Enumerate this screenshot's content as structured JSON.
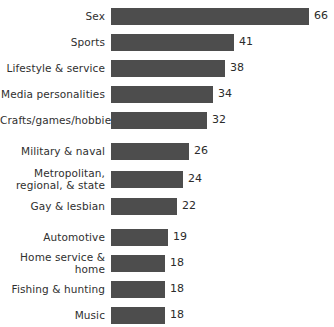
{
  "chart_data": {
    "type": "bar",
    "orientation": "horizontal",
    "title": "",
    "subtitle": "",
    "xlabel": "",
    "ylabel": "",
    "grid": false,
    "legend": false,
    "axis_visible": false,
    "value_labels": true,
    "xlim": [
      0,
      66
    ],
    "bar_color": "#4d4d4d",
    "background_color": "#ffffff",
    "categories": [
      "Sex",
      "Sports",
      "Lifestyle & service",
      "Media personalities",
      "Crafts/games/hobbies",
      "Military & naval",
      "Metropolitan,\nregional, & state",
      "Gay & lesbian",
      "Automotive",
      "Home service & home",
      "Fishing & hunting",
      "Music"
    ],
    "values": [
      66,
      41,
      38,
      34,
      32,
      26,
      24,
      22,
      19,
      18,
      18,
      18
    ],
    "groups": [
      {
        "rows": [
          0,
          1,
          2,
          3,
          4
        ]
      },
      {
        "rows": [
          5,
          6,
          7
        ]
      },
      {
        "rows": [
          8,
          9,
          10,
          11
        ]
      }
    ]
  },
  "rows": [
    {
      "label": "Sex",
      "value": "66"
    },
    {
      "label": "Sports",
      "value": "41"
    },
    {
      "label": "Lifestyle & service",
      "value": "38"
    },
    {
      "label": "Media personalities",
      "value": "34"
    },
    {
      "label": "Crafts/games/hobbies",
      "value": "32"
    },
    {
      "label": "Military & naval",
      "value": "26"
    },
    {
      "label": "Metropolitan,\nregional, & state",
      "value": "24"
    },
    {
      "label": "Gay & lesbian",
      "value": "22"
    },
    {
      "label": "Automotive",
      "value": "19"
    },
    {
      "label": "Home service & home",
      "value": "18"
    },
    {
      "label": "Fishing & hunting",
      "value": "18"
    },
    {
      "label": "Music",
      "value": "18"
    }
  ]
}
